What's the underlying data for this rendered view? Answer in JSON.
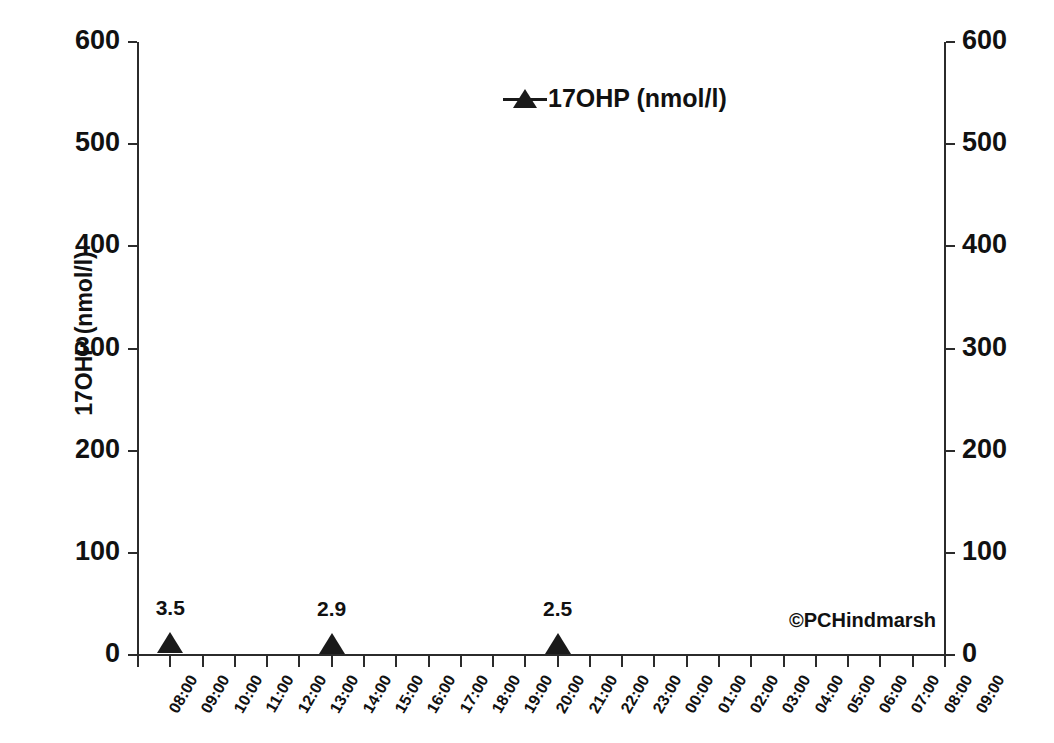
{
  "chart_data": {
    "type": "scatter",
    "title": "",
    "subtitle": "",
    "xlabel": "",
    "ylabel": "17OHP (nmol/l)",
    "ylabel_right": "17OHP (nmol/l)",
    "ylim": [
      0,
      600
    ],
    "ytick_values": [
      0,
      100,
      200,
      300,
      400,
      500,
      600
    ],
    "ytick_labels": [
      "0",
      "100",
      "200",
      "300",
      "400",
      "500",
      "600"
    ],
    "ytick_labels_right": [
      "0",
      "100",
      "200",
      "300",
      "400",
      "500",
      "600"
    ],
    "grid": false,
    "legend_position": "top-center",
    "legend": [
      "17OHP (nmol/l)"
    ],
    "marker": "triangle",
    "marker_color": "#1a1a1a",
    "x": [
      "08:00",
      "09:00",
      "10:00",
      "11:00",
      "12:00",
      "13:00",
      "14:00",
      "15:00",
      "16:00",
      "17:00",
      "18:00",
      "19:00",
      "20:00",
      "21:00",
      "22:00",
      "23:00",
      "00:00",
      "01:00",
      "02:00",
      "03:00",
      "04:00",
      "05:00",
      "06:00",
      "07:00",
      "08:00",
      "09:00"
    ],
    "series": [
      {
        "name": "17OHP (nmol/l)",
        "points": [
          {
            "x": "09:00",
            "x_index": 1,
            "y": 3.5,
            "label": "3.5"
          },
          {
            "x": "14:00",
            "x_index": 6,
            "y": 2.9,
            "label": "2.9"
          },
          {
            "x": "21:00",
            "x_index": 13,
            "y": 2.5,
            "label": "2.5"
          }
        ]
      }
    ],
    "annotations": [
      {
        "name": "credit",
        "text": "©PCHindmarsh"
      }
    ]
  },
  "credit": "©PCHindmarsh",
  "colors": {
    "axis": "#2b2b2b",
    "marker": "#1a1a1a",
    "text": "#111111",
    "background": "#ffffff"
  }
}
